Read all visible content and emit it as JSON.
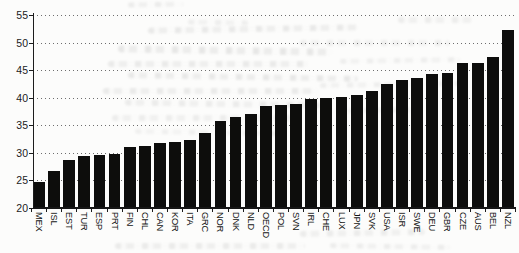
{
  "chart_data": {
    "type": "bar",
    "title": "",
    "xlabel": "",
    "ylabel": "",
    "categories": [
      "MEX",
      "ISL",
      "EST",
      "TUR",
      "ESP",
      "PRT",
      "FIN",
      "CHL",
      "CAN",
      "KOR",
      "ITA",
      "GRC",
      "NOR",
      "DNK",
      "NLD",
      "OECD",
      "POL",
      "SVN",
      "IRL",
      "CHE",
      "LUX",
      "JPN",
      "SVK",
      "USA",
      "ISR",
      "SWE",
      "DEU",
      "GBR",
      "CZE",
      "AUS",
      "BEL",
      "NZL"
    ],
    "values": [
      24.7,
      26.6,
      28.6,
      29.3,
      29.5,
      29.7,
      31.0,
      31.2,
      31.7,
      31.9,
      32.3,
      33.6,
      35.8,
      36.4,
      37.0,
      38.4,
      38.6,
      38.9,
      39.7,
      39.9,
      40.1,
      40.4,
      41.1,
      42.5,
      43.1,
      43.5,
      44.3,
      44.5,
      46.2,
      46.3,
      47.4,
      52.2
    ],
    "ylim": [
      20,
      55
    ],
    "yticks": [
      20,
      25,
      30,
      35,
      40,
      45,
      50,
      55
    ],
    "ytick_labels": [
      "20",
      "25",
      "30",
      "35",
      "40",
      "45",
      "50",
      "55"
    ],
    "grid": "horizontal-dotted",
    "legend": "none",
    "bar_color": "#0d0d0c",
    "axis_color": "#1c1c1c",
    "gridline_color": "#6e6e6e",
    "xlabel_rotation_deg": 90
  }
}
